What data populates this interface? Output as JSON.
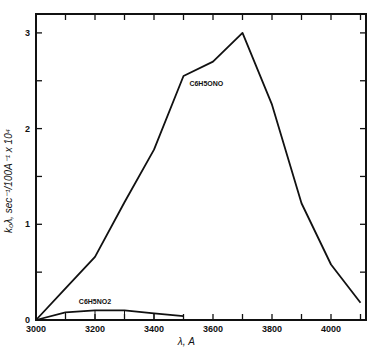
{
  "chart_data": {
    "type": "line",
    "title": "",
    "xlabel": "λ, A",
    "ylabel": "k₀λ, sec⁻¹/100A⁻¹ x 10⁴",
    "xlim": [
      3000,
      4120
    ],
    "ylim": [
      0,
      3.13
    ],
    "x_ticks": [
      3000,
      3200,
      3400,
      3600,
      3800,
      4000
    ],
    "x_tick_labels": [
      "3000",
      "3200",
      "3400",
      "3600",
      "3800",
      "4000"
    ],
    "x_minor_ticks": [
      3100,
      3300,
      3500,
      3700,
      3900,
      4100
    ],
    "y_ticks": [
      0,
      1,
      2,
      3
    ],
    "y_tick_labels": [
      "0",
      "1",
      "2",
      "3"
    ],
    "y_minor_ticks": [
      0.5,
      1.5,
      2.5
    ],
    "grid": false,
    "legend": "none (inline curve labels)",
    "x": [
      3000,
      3100,
      3200,
      3300,
      3400,
      3500,
      3600,
      3700,
      3800,
      3900,
      4000,
      4100
    ],
    "series": [
      {
        "name": "C6H5ONO",
        "label_text": "C6H5ONO",
        "x": [
          3000,
          3100,
          3200,
          3300,
          3400,
          3500,
          3600,
          3700,
          3800,
          3900,
          4000,
          4100
        ],
        "values": [
          0.0,
          0.33,
          0.66,
          1.23,
          1.78,
          2.55,
          2.7,
          3.0,
          2.25,
          1.22,
          0.58,
          0.18
        ]
      },
      {
        "name": "C6H5NO2",
        "label_text": "C6H5NO2",
        "x": [
          3000,
          3100,
          3200,
          3300,
          3400,
          3500
        ],
        "values": [
          0.0,
          0.08,
          0.1,
          0.1,
          0.07,
          0.04
        ]
      }
    ],
    "annotations": [
      "C6H5ONO",
      "C6H5NO2"
    ]
  },
  "plot": {
    "left_px": 36,
    "right_px": 366,
    "top_px": 14,
    "bottom_px": 320,
    "x0_value": 3000,
    "x_px_per_100": 29.5,
    "y_px_per_unit": 95.7
  }
}
